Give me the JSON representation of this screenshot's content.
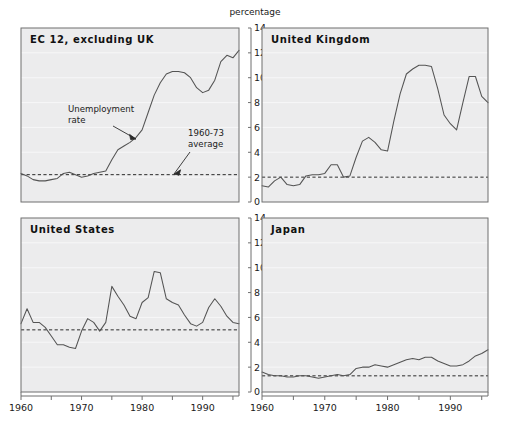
{
  "figure": {
    "axis_title": "percentage",
    "background": "#ffffff",
    "plot_background": "#ececed",
    "line_color": "#545454",
    "average_line_color": "#2b2b2b"
  },
  "annotations": {
    "series_label_line1": "Unemployment",
    "series_label_line2": "rate",
    "average_label_line1": "1960-73",
    "average_label_line2": "average"
  },
  "chart_data": [
    {
      "type": "line",
      "title": "EC 12, excluding UK",
      "xlabel": "",
      "ylabel": "percentage",
      "xlim": [
        1960,
        1996
      ],
      "ylim": [
        0,
        14
      ],
      "yticks": [
        0,
        2,
        4,
        6,
        8,
        10,
        12,
        14
      ],
      "xticks": [
        1960,
        1970,
        1980,
        1990
      ],
      "grid": true,
      "legend": "none",
      "reference_line": {
        "label": "1960-73 average",
        "value": 2.2,
        "style": "dashed"
      },
      "series": [
        {
          "name": "Unemployment rate",
          "x": [
            1960,
            1961,
            1962,
            1963,
            1964,
            1965,
            1966,
            1967,
            1968,
            1969,
            1970,
            1971,
            1972,
            1973,
            1974,
            1975,
            1976,
            1977,
            1978,
            1979,
            1980,
            1981,
            1982,
            1983,
            1984,
            1985,
            1986,
            1987,
            1988,
            1989,
            1990,
            1991,
            1992,
            1993,
            1994,
            1995,
            1996
          ],
          "values": [
            2.3,
            2.1,
            1.8,
            1.7,
            1.7,
            1.8,
            1.9,
            2.3,
            2.4,
            2.2,
            2.0,
            2.1,
            2.3,
            2.4,
            2.5,
            3.4,
            4.2,
            4.5,
            4.8,
            5.2,
            5.8,
            7.2,
            8.6,
            9.6,
            10.3,
            10.5,
            10.5,
            10.4,
            10.0,
            9.2,
            8.8,
            9.0,
            9.8,
            11.3,
            11.8,
            11.6,
            12.2
          ]
        }
      ]
    },
    {
      "type": "line",
      "title": "United Kingdom",
      "xlabel": "",
      "ylabel": "percentage",
      "xlim": [
        1960,
        1996
      ],
      "ylim": [
        0,
        14
      ],
      "yticks": [
        0,
        2,
        4,
        6,
        8,
        10,
        12,
        14
      ],
      "xticks": [
        1960,
        1970,
        1980,
        1990
      ],
      "grid": true,
      "legend": "none",
      "reference_line": {
        "label": "1960-73 average",
        "value": 2.0,
        "style": "dashed"
      },
      "series": [
        {
          "name": "Unemployment rate",
          "x": [
            1960,
            1961,
            1962,
            1963,
            1964,
            1965,
            1966,
            1967,
            1968,
            1969,
            1970,
            1971,
            1972,
            1973,
            1974,
            1975,
            1976,
            1977,
            1978,
            1979,
            1980,
            1981,
            1982,
            1983,
            1984,
            1985,
            1986,
            1987,
            1988,
            1989,
            1990,
            1991,
            1992,
            1993,
            1994,
            1995,
            1996
          ],
          "values": [
            1.3,
            1.2,
            1.7,
            2.0,
            1.4,
            1.3,
            1.4,
            2.1,
            2.2,
            2.2,
            2.3,
            3.0,
            3.0,
            2.0,
            2.1,
            3.6,
            4.9,
            5.2,
            4.8,
            4.2,
            4.1,
            6.5,
            8.7,
            10.3,
            10.7,
            11.0,
            11.0,
            10.9,
            9.1,
            7.0,
            6.3,
            5.8,
            8.0,
            10.1,
            10.1,
            8.5,
            8.0
          ]
        }
      ]
    },
    {
      "type": "line",
      "title": "United States",
      "xlabel": "",
      "ylabel": "percentage",
      "xlim": [
        1960,
        1996
      ],
      "ylim": [
        0,
        14
      ],
      "yticks": [
        0,
        2,
        4,
        6,
        8,
        10,
        12,
        14
      ],
      "xticks": [
        1960,
        1970,
        1980,
        1990
      ],
      "grid": true,
      "legend": "none",
      "reference_line": {
        "label": "1960-73 average",
        "value": 5.0,
        "style": "dashed"
      },
      "series": [
        {
          "name": "Unemployment rate",
          "x": [
            1960,
            1961,
            1962,
            1963,
            1964,
            1965,
            1966,
            1967,
            1968,
            1969,
            1970,
            1971,
            1972,
            1973,
            1974,
            1975,
            1976,
            1977,
            1978,
            1979,
            1980,
            1981,
            1982,
            1983,
            1984,
            1985,
            1986,
            1987,
            1988,
            1989,
            1990,
            1991,
            1992,
            1993,
            1994,
            1995,
            1996
          ],
          "values": [
            5.5,
            6.7,
            5.6,
            5.6,
            5.2,
            4.5,
            3.8,
            3.8,
            3.6,
            3.5,
            4.9,
            5.9,
            5.6,
            4.9,
            5.6,
            8.5,
            7.7,
            7.0,
            6.1,
            5.9,
            7.2,
            7.6,
            9.7,
            9.6,
            7.5,
            7.2,
            7.0,
            6.2,
            5.5,
            5.3,
            5.6,
            6.8,
            7.5,
            6.9,
            6.1,
            5.6,
            5.5
          ]
        }
      ]
    },
    {
      "type": "line",
      "title": "Japan",
      "xlabel": "",
      "ylabel": "percentage",
      "xlim": [
        1960,
        1996
      ],
      "ylim": [
        0,
        14
      ],
      "yticks": [
        0,
        2,
        4,
        6,
        8,
        10,
        12,
        14
      ],
      "xticks": [
        1960,
        1970,
        1980,
        1990
      ],
      "grid": true,
      "legend": "none",
      "reference_line": {
        "label": "1960-73 average",
        "value": 1.3,
        "style": "dashed"
      },
      "series": [
        {
          "name": "Unemployment rate",
          "x": [
            1960,
            1961,
            1962,
            1963,
            1964,
            1965,
            1966,
            1967,
            1968,
            1969,
            1970,
            1971,
            1972,
            1973,
            1974,
            1975,
            1976,
            1977,
            1978,
            1979,
            1980,
            1981,
            1982,
            1983,
            1984,
            1985,
            1986,
            1987,
            1988,
            1989,
            1990,
            1991,
            1992,
            1993,
            1994,
            1995,
            1996
          ],
          "values": [
            1.6,
            1.4,
            1.3,
            1.3,
            1.2,
            1.2,
            1.3,
            1.3,
            1.2,
            1.1,
            1.2,
            1.3,
            1.4,
            1.3,
            1.4,
            1.9,
            2.0,
            2.0,
            2.2,
            2.1,
            2.0,
            2.2,
            2.4,
            2.6,
            2.7,
            2.6,
            2.8,
            2.8,
            2.5,
            2.3,
            2.1,
            2.1,
            2.2,
            2.5,
            2.9,
            3.1,
            3.4
          ]
        }
      ]
    }
  ]
}
